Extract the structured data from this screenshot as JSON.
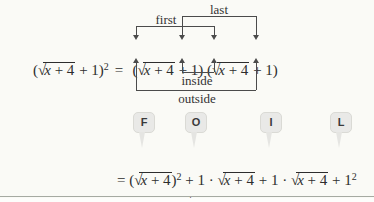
{
  "labels": {
    "first": "first",
    "last": "last",
    "inside": "inside",
    "outside": "outside"
  },
  "equation": {
    "open": "(",
    "sqrt": "√",
    "rad_var": "x",
    "rad_rest": " + 4",
    "close": " + 1)",
    "exp": "2",
    "equals": "="
  },
  "foil": {
    "letters": [
      "F",
      "O",
      "I",
      "L"
    ]
  },
  "expansion": {
    "line1": {
      "head": "= (",
      "sqrt": "√",
      "rad_var": "x",
      "rad_rest": " + 4",
      "close": ")",
      "exp": "2",
      "mid1": " + 1 · ",
      "mid2": " + 1 · ",
      "tail": " + 1",
      "tail_exp": "2"
    },
    "line2": {
      "head": "= ",
      "pre_var": "x",
      "pre_rest": " + 4 + 2",
      "sqrt": "√",
      "rad_var": "x",
      "rad_rest": " + 4",
      "tail": " + 1"
    }
  },
  "colors": {
    "ink": "#2d2d2d",
    "line": "#4b4b4b",
    "badge_bg": "#e9e9e7",
    "badge_border": "#dadad5",
    "badge_text": "#3a3a3a",
    "rule": "#a6aaa2",
    "background": "#fafaf6"
  }
}
